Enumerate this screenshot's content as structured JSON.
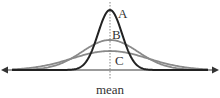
{
  "diagram": {
    "type": "normal-distribution-comparison",
    "axis_label": "mean",
    "curves": [
      {
        "id": "A",
        "label": "A",
        "description": "tall narrow curve",
        "peak_y": 10,
        "spread": 12,
        "color": "#222222",
        "stroke_width": 2
      },
      {
        "id": "B",
        "label": "B",
        "description": "medium curve",
        "peak_y": 40,
        "spread": 28,
        "color": "#8a8a8a",
        "stroke_width": 1.8
      },
      {
        "id": "C",
        "label": "C",
        "description": "flattest wide curve",
        "peak_y": 51,
        "spread": 38,
        "color": "#8a8a8a",
        "stroke_width": 1.8
      }
    ],
    "colors": {
      "axis": "#555555",
      "mean_line": "#777777",
      "background": "#ffffff"
    }
  }
}
